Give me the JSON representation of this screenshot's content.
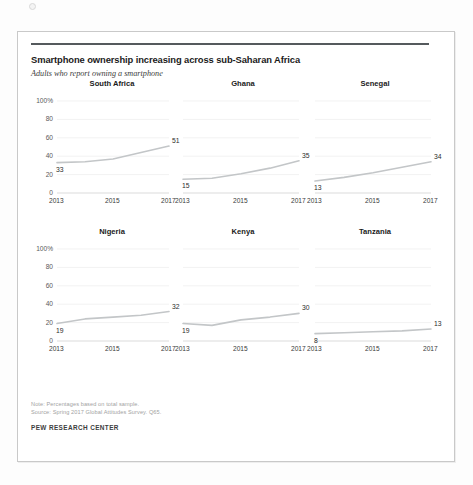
{
  "card": {
    "title": "Smartphone ownership increasing across sub-Saharan Africa",
    "subtitle": "Adults who report owning a smartphone",
    "note": "Note: Percentages based on total sample.",
    "source": "Source: Spring 2017 Global Attitudes Survey. Q65.",
    "brand": "PEW RESEARCH CENTER"
  },
  "axis": {
    "y_ticks": [
      "100%",
      "80",
      "60",
      "40",
      "20",
      "0"
    ],
    "x_ticks": [
      "2013",
      "2015",
      "2017"
    ]
  },
  "chart_data": [
    {
      "type": "line",
      "title": "South Africa",
      "xlabel": "",
      "ylabel": "",
      "ylim": [
        0,
        100
      ],
      "xlim": [
        2013,
        2017
      ],
      "grid": true,
      "x": [
        2013,
        2014,
        2015,
        2016,
        2017
      ],
      "values": [
        33,
        34,
        37,
        44,
        51
      ],
      "first_label": "33",
      "last_label": "51"
    },
    {
      "type": "line",
      "title": "Ghana",
      "xlabel": "",
      "ylabel": "",
      "ylim": [
        0,
        100
      ],
      "xlim": [
        2013,
        2017
      ],
      "grid": true,
      "x": [
        2013,
        2014,
        2015,
        2016,
        2017
      ],
      "values": [
        15,
        16,
        21,
        27,
        35
      ],
      "first_label": "15",
      "last_label": "35"
    },
    {
      "type": "line",
      "title": "Senegal",
      "xlabel": "",
      "ylabel": "",
      "ylim": [
        0,
        100
      ],
      "xlim": [
        2013,
        2017
      ],
      "grid": true,
      "x": [
        2013,
        2014,
        2015,
        2016,
        2017
      ],
      "values": [
        13,
        17,
        22,
        28,
        34
      ],
      "first_label": "13",
      "last_label": "34"
    },
    {
      "type": "line",
      "title": "Nigeria",
      "xlabel": "",
      "ylabel": "",
      "ylim": [
        0,
        100
      ],
      "xlim": [
        2013,
        2017
      ],
      "grid": true,
      "x": [
        2013,
        2014,
        2015,
        2016,
        2017
      ],
      "values": [
        19,
        24,
        26,
        28,
        32
      ],
      "first_label": "19",
      "last_label": "32"
    },
    {
      "type": "line",
      "title": "Kenya",
      "xlabel": "",
      "ylabel": "",
      "ylim": [
        0,
        100
      ],
      "xlim": [
        2013,
        2017
      ],
      "grid": true,
      "x": [
        2013,
        2014,
        2015,
        2016,
        2017
      ],
      "values": [
        19,
        17,
        23,
        26,
        30
      ],
      "first_label": "19",
      "last_label": "30"
    },
    {
      "type": "line",
      "title": "Tanzania",
      "xlabel": "",
      "ylabel": "",
      "ylim": [
        0,
        100
      ],
      "xlim": [
        2013,
        2017
      ],
      "grid": true,
      "x": [
        2013,
        2014,
        2015,
        2016,
        2017
      ],
      "values": [
        8,
        9,
        10,
        11,
        13
      ],
      "first_label": "8",
      "last_label": "13"
    }
  ],
  "style": {
    "line_color": "#c3c6c8",
    "grid_color": "#ececec",
    "rule_color": "#555a5d"
  }
}
